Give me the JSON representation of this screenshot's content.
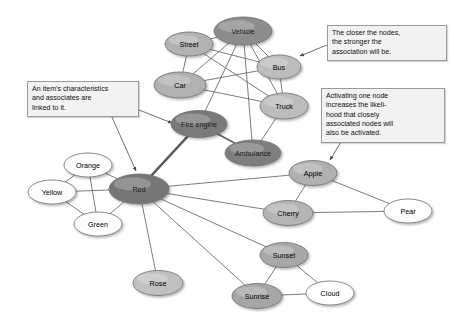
{
  "figure": {
    "background": "#ffffff",
    "width": 454,
    "height": 326
  },
  "style": {
    "edge_color": "#5a5a5a",
    "node_stroke": "#6e6e6e",
    "label_color": "#000000",
    "annotation_bg": "#f2f2f2",
    "annotation_border": "#9a9a9a",
    "shade_activated": "#7c7c7c",
    "shade_strong": "#a8a8a8",
    "shade_medium": "#bfbfbf",
    "shade_light": "#d8d8d8",
    "shade_white": "#ffffff"
  },
  "nodes": [
    {
      "id": "vehicle",
      "label": "Vehicle",
      "x": 243,
      "y": 31,
      "rx": 29,
      "ry": 14,
      "shade": "#8d8d8d",
      "activation": "high"
    },
    {
      "id": "street",
      "label": "Street",
      "x": 189,
      "y": 44,
      "rx": 24,
      "ry": 12,
      "shade": "#b2b2b2",
      "activation": "medium"
    },
    {
      "id": "bus",
      "label": "Bus",
      "x": 279,
      "y": 67,
      "rx": 22,
      "ry": 12,
      "shade": "#bcbcbc",
      "activation": "medium"
    },
    {
      "id": "car",
      "label": "Car",
      "x": 180,
      "y": 85,
      "rx": 26,
      "ry": 13,
      "shade": "#b0b0b0",
      "activation": "medium"
    },
    {
      "id": "truck",
      "label": "Truck",
      "x": 284,
      "y": 106,
      "rx": 24,
      "ry": 13,
      "shade": "#bcbcbc",
      "activation": "medium"
    },
    {
      "id": "fire-engine",
      "label": "Fire engine",
      "x": 199,
      "y": 124,
      "rx": 28,
      "ry": 13.5,
      "shade": "#7a7a7a",
      "activation": "high"
    },
    {
      "id": "ambulance",
      "label": "Ambulance",
      "x": 253,
      "y": 153,
      "rx": 28,
      "ry": 13,
      "shade": "#7e7e7e",
      "activation": "high"
    },
    {
      "id": "apple",
      "label": "Apple",
      "x": 313,
      "y": 173,
      "rx": 24,
      "ry": 12.5,
      "shade": "#b0b0b0",
      "activation": "medium"
    },
    {
      "id": "orange",
      "label": "Orange",
      "x": 88,
      "y": 165,
      "rx": 24,
      "ry": 12,
      "shade": "#fdfdfd",
      "activation": "none"
    },
    {
      "id": "red",
      "label": "Red",
      "x": 139,
      "y": 189,
      "rx": 30,
      "ry": 15,
      "shade": "#767676",
      "activation": "high"
    },
    {
      "id": "yellow",
      "label": "Yellow",
      "x": 52,
      "y": 192,
      "rx": 24,
      "ry": 12,
      "shade": "#fdfdfd",
      "activation": "none"
    },
    {
      "id": "cherry",
      "label": "Cherry",
      "x": 288,
      "y": 213,
      "rx": 25,
      "ry": 12.5,
      "shade": "#b4b4b4",
      "activation": "medium"
    },
    {
      "id": "pear",
      "label": "Pear",
      "x": 408,
      "y": 211,
      "rx": 24,
      "ry": 12,
      "shade": "#fdfdfd",
      "activation": "none"
    },
    {
      "id": "green",
      "label": "Green",
      "x": 98,
      "y": 224,
      "rx": 24,
      "ry": 12,
      "shade": "#fdfdfd",
      "activation": "none"
    },
    {
      "id": "sunset",
      "label": "Sunset",
      "x": 284,
      "y": 255,
      "rx": 24,
      "ry": 12.5,
      "shade": "#a8a8a8",
      "activation": "medium"
    },
    {
      "id": "rose",
      "label": "Rose",
      "x": 158,
      "y": 283,
      "rx": 25,
      "ry": 12.5,
      "shade": "#c0c0c0",
      "activation": "low"
    },
    {
      "id": "sunrise",
      "label": "Sunrise",
      "x": 257,
      "y": 296,
      "rx": 25,
      "ry": 12.5,
      "shade": "#a6a6a6",
      "activation": "medium"
    },
    {
      "id": "cloud",
      "label": "Cloud",
      "x": 330,
      "y": 293,
      "rx": 24,
      "ry": 12,
      "shade": "#fdfdfd",
      "activation": "none"
    }
  ],
  "edges": [
    {
      "from": "vehicle",
      "to": "street",
      "width": 0.8
    },
    {
      "from": "vehicle",
      "to": "bus",
      "width": 0.8
    },
    {
      "from": "vehicle",
      "to": "car",
      "width": 0.8
    },
    {
      "from": "vehicle",
      "to": "truck",
      "width": 0.8
    },
    {
      "from": "vehicle",
      "to": "fire-engine",
      "width": 0.8
    },
    {
      "from": "vehicle",
      "to": "ambulance",
      "width": 0.8
    },
    {
      "from": "street",
      "to": "car",
      "width": 0.8
    },
    {
      "from": "street",
      "to": "bus",
      "width": 0.8
    },
    {
      "from": "street",
      "to": "truck",
      "width": 0.8
    },
    {
      "from": "car",
      "to": "bus",
      "width": 0.8
    },
    {
      "from": "car",
      "to": "truck",
      "width": 0.8
    },
    {
      "from": "bus",
      "to": "truck",
      "width": 0.8
    },
    {
      "from": "truck",
      "to": "ambulance",
      "width": 0.8
    },
    {
      "from": "fire-engine",
      "to": "ambulance",
      "width": 1.6
    },
    {
      "from": "fire-engine",
      "to": "red",
      "width": 2.4
    },
    {
      "from": "red",
      "to": "orange",
      "width": 0.8
    },
    {
      "from": "red",
      "to": "yellow",
      "width": 0.8
    },
    {
      "from": "red",
      "to": "green",
      "width": 0.8
    },
    {
      "from": "orange",
      "to": "yellow",
      "width": 0.8
    },
    {
      "from": "orange",
      "to": "green",
      "width": 0.8
    },
    {
      "from": "yellow",
      "to": "green",
      "width": 0.8
    },
    {
      "from": "red",
      "to": "apple",
      "width": 0.8
    },
    {
      "from": "red",
      "to": "cherry",
      "width": 0.8
    },
    {
      "from": "red",
      "to": "rose",
      "width": 0.8
    },
    {
      "from": "red",
      "to": "sunset",
      "width": 0.8
    },
    {
      "from": "red",
      "to": "sunrise",
      "width": 0.8
    },
    {
      "from": "apple",
      "to": "cherry",
      "width": 0.8
    },
    {
      "from": "apple",
      "to": "pear",
      "width": 0.8
    },
    {
      "from": "cherry",
      "to": "pear",
      "width": 0.8
    },
    {
      "from": "sunset",
      "to": "sunrise",
      "width": 0.8
    },
    {
      "from": "sunset",
      "to": "cloud",
      "width": 0.8
    },
    {
      "from": "sunrise",
      "to": "cloud",
      "width": 0.8
    }
  ],
  "annotations": [
    {
      "id": "ann-closer-nodes",
      "lines": [
        "The closer the nodes,",
        "the stronger the",
        "association will be."
      ],
      "x": 327,
      "y": 25,
      "w": 120,
      "h": 34,
      "leaders": [
        {
          "x1": 327,
          "y1": 45,
          "x2": 300,
          "y2": 56
        }
      ]
    },
    {
      "id": "ann-item-characteristics",
      "lines": [
        "An item's characteristics",
        "and associates are",
        "linked to it."
      ],
      "x": 27,
      "y": 81,
      "w": 112,
      "h": 34,
      "leaders": [
        {
          "x1": 139,
          "y1": 110,
          "x2": 172,
          "y2": 123
        },
        {
          "x1": 111,
          "y1": 115,
          "x2": 136,
          "y2": 171
        }
      ]
    },
    {
      "id": "ann-activating-node",
      "lines": [
        "Activating one node",
        "increases the likeli-",
        "hood that closely",
        "associated nodes will",
        "also be activated."
      ],
      "x": 321,
      "y": 88,
      "w": 124,
      "h": 54,
      "leaders": [
        {
          "x1": 341,
          "y1": 142,
          "x2": 330,
          "y2": 160
        }
      ]
    }
  ]
}
